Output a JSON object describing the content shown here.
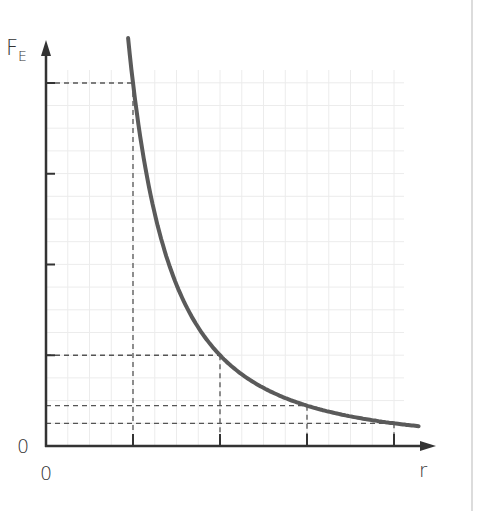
{
  "chart_data": {
    "type": "line",
    "title": "",
    "xlabel": "r",
    "ylabel": "F",
    "ylabel_subscript": "E",
    "x_origin_label": "0",
    "y_origin_label": "0",
    "relationship": "inverse-square (F ∝ 1/r²)",
    "grid": true,
    "series": [
      {
        "name": "F_E vs r",
        "color": "#5a5a5a",
        "x": [
          1,
          2,
          3,
          4
        ],
        "y": [
          1,
          0.25,
          0.111,
          0.0625
        ]
      }
    ],
    "marked_points": [
      {
        "r": "r₁",
        "F": "F"
      },
      {
        "r": "2r₁",
        "F": "F/4"
      },
      {
        "r": "3r₁",
        "F": "F/9"
      },
      {
        "r": "4r₁",
        "F": "F/16"
      }
    ],
    "y_ticks": 4,
    "x_ticks": 4
  },
  "labels": {
    "y_axis": "F",
    "y_axis_sub": "E",
    "x_axis": "r",
    "origin_y": "0",
    "origin_x": "0"
  },
  "colors": {
    "axis": "#333333",
    "curve": "#5a5a5a",
    "dash": "#555555",
    "grid": "#ececec"
  }
}
